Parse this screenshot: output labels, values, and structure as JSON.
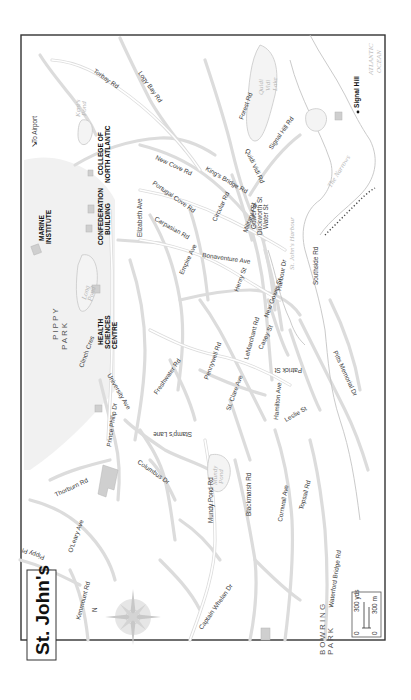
{
  "map": {
    "title": "St. John's",
    "orientation": "rotated-90-ccw",
    "frame": {
      "x": 20,
      "y": 35,
      "width": 164,
      "height": 105
    },
    "colors": {
      "road": "#dcdcdc",
      "frame": "#333333",
      "park": "#f1f1f1",
      "building": "#cfcfcf",
      "text": "#3a3a3a",
      "water_text": "#b8b8b8"
    },
    "landmarks": [
      {
        "label": "MARINE INSTITUTE"
      },
      {
        "label": "CONFEDERATION BUILDING"
      },
      {
        "label": "COLLEGE OF NORTH ATLANTIC"
      },
      {
        "label": "HEALTH SCIENCES CENTRE"
      },
      {
        "label": "Signal Hill"
      }
    ],
    "areas": {
      "pippy_park": "PIPPY PARK",
      "bowring_park": "BOWRING PARK"
    },
    "water": {
      "ocean": "ATLANTIC OCEAN",
      "harbour": "St. John's Harbour",
      "narrows": "The Narrows",
      "lake": "Quidi Vidi Lake",
      "long_pond": "Long Pond",
      "kents_pond": "Kent's Pond",
      "mundy_pond": "Mundy Pond"
    },
    "airport": "To Airport",
    "streets": [
      "Torbay Rd",
      "Logy Bay Rd",
      "New Cove Rd",
      "Portugal Cove Rd",
      "Forest Rd",
      "Signal Hill Rd",
      "Quidi Vidi Rd",
      "King's Bridge Rd",
      "Circular Rd",
      "Military Rd",
      "Gower St",
      "Duckworth St",
      "Water St",
      "Harbour Dr",
      "Southside Rd",
      "Bonaventure Ave",
      "Henry St",
      "New Gower St",
      "Carpasian Rd",
      "Empire Ave",
      "Elizabeth Ave",
      "Freshwater Rd",
      "Pennywell Rd",
      "St. Clare Ave",
      "LeMarchant Rd",
      "Casey St",
      "Patrick St",
      "Hamilton Ave",
      "Leslie St",
      "Pitts Memorial Dr",
      "Clinch Cres",
      "University Ave",
      "Prince Philip Dr",
      "Stamp's Lane",
      "Columbus Dr",
      "Thorburn Rd",
      "O'Leary Ave",
      "Pippy Pl",
      "Kenmount Rd",
      "Mundy Pond Rd",
      "Blackmarsh Rd",
      "Cornwall Ave",
      "Topsail Rd",
      "Captain Whelan Dr",
      "Waterford Bridge Rd"
    ],
    "compass": {
      "north_label": "N"
    },
    "scale": {
      "zero": "0",
      "yards": "300 yds",
      "meters": "300 m"
    }
  }
}
